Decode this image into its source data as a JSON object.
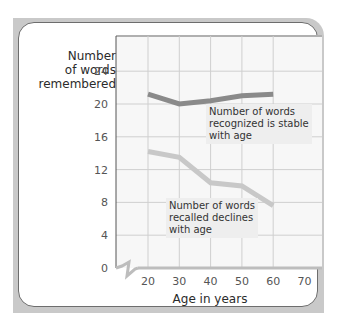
{
  "chart_data": {
    "type": "line",
    "title": "",
    "xlabel": "Age in years",
    "ylabel": "Number of words remembered",
    "x": [
      20,
      30,
      40,
      50,
      60
    ],
    "xticks": [
      20,
      30,
      40,
      50,
      60,
      70
    ],
    "yticks": [
      0,
      4,
      8,
      12,
      16,
      20,
      24
    ],
    "xlim": [
      10,
      70
    ],
    "ylim": [
      0,
      28
    ],
    "grid": true,
    "axis_break": "x-axis break between 0 and 20",
    "series": [
      {
        "name": "Recognized",
        "values": [
          21.2,
          20.0,
          20.4,
          21.0,
          21.2
        ],
        "color": "#8a8a8a"
      },
      {
        "name": "Recalled",
        "values": [
          14.2,
          13.5,
          10.4,
          10.0,
          7.6
        ],
        "color": "#c8c8c8"
      }
    ],
    "annotations": [
      "Number of words recognized is stable with age",
      "Number of words recalled declines with age"
    ]
  },
  "labels": {
    "ylabel_line1": "Number",
    "ylabel_line2": "of words",
    "ylabel_line3": "remembered",
    "xlabel": "Age in years",
    "ann_recognized_1": "Number of words",
    "ann_recognized_2": "recognized is stable",
    "ann_recognized_3": "with age",
    "ann_recalled_1": "Number of words",
    "ann_recalled_2": "recalled declines",
    "ann_recalled_3": "with age"
  }
}
